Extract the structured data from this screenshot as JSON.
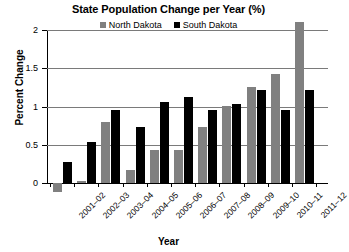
{
  "chart_data": {
    "type": "bar",
    "title": "State Population Change per Year (%)",
    "xlabel": "Year",
    "ylabel": "Percent Change",
    "ylim": [
      -0.2,
      2.15
    ],
    "yticks": [
      "0",
      "0.5",
      "1",
      "1.5",
      "2"
    ],
    "ytick_values": [
      0,
      0.5,
      1,
      1.5,
      2
    ],
    "grid": "horizontal",
    "legend_position": "top-center",
    "categories": [
      "2001–02",
      "2002–03",
      "2003–04",
      "2004–05",
      "2005–06",
      "2006–07",
      "2007–08",
      "2008–09",
      "2009–10",
      "2010–11",
      "2011–12"
    ],
    "series": [
      {
        "name": "North Dakota",
        "color": "#808080",
        "values": [
          -0.12,
          0.02,
          0.8,
          0.17,
          0.43,
          0.43,
          0.73,
          1.01,
          1.25,
          1.42,
          2.1
        ]
      },
      {
        "name": "South Dakota",
        "color": "#000000",
        "values": [
          0.28,
          0.54,
          0.95,
          0.73,
          1.06,
          1.12,
          0.95,
          1.03,
          1.22,
          0.95,
          1.22
        ]
      }
    ]
  }
}
